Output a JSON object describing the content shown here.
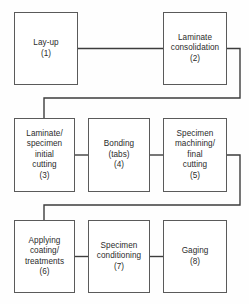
{
  "diagram": {
    "type": "process-flowchart",
    "title": "",
    "orientation": "serpentine-left-to-right",
    "colors": {
      "background": "#fefefe",
      "box_fill": "#ffffff",
      "box_border": "#5a5a5a",
      "connector": "#3d3d3d",
      "text": "#2b2b2b"
    },
    "nodes": [
      {
        "id": "node-1",
        "number": "(1)",
        "lines": [
          "Lay-up"
        ],
        "x": 14,
        "y": 12,
        "w": 64,
        "h": 73,
        "row": 1
      },
      {
        "id": "node-2",
        "number": "(2)",
        "lines": [
          "Laminate",
          "consolidation"
        ],
        "x": 163,
        "y": 12,
        "w": 64,
        "h": 73,
        "row": 1
      },
      {
        "id": "node-3",
        "number": "(3)",
        "lines": [
          "Laminate/",
          "specimen",
          "initial",
          "cutting"
        ],
        "x": 14,
        "y": 118,
        "w": 61,
        "h": 74,
        "row": 2
      },
      {
        "id": "node-4",
        "number": "(4)",
        "lines": [
          "Bonding",
          "(tabs)"
        ],
        "x": 88,
        "y": 118,
        "w": 62,
        "h": 74,
        "row": 2
      },
      {
        "id": "node-5",
        "number": "(5)",
        "lines": [
          "Specimen",
          "machining/",
          "final",
          "cutting"
        ],
        "x": 163,
        "y": 118,
        "w": 64,
        "h": 74,
        "row": 2
      },
      {
        "id": "node-6",
        "number": "(6)",
        "lines": [
          "Applying",
          "coating/",
          "treatments"
        ],
        "x": 14,
        "y": 220,
        "w": 61,
        "h": 73,
        "row": 3
      },
      {
        "id": "node-7",
        "number": "(7)",
        "lines": [
          "Specimen",
          "conditioning"
        ],
        "x": 88,
        "y": 220,
        "w": 62,
        "h": 73,
        "row": 3
      },
      {
        "id": "node-8",
        "number": "(8)",
        "lines": [
          "Gaging"
        ],
        "x": 163,
        "y": 220,
        "w": 64,
        "h": 73,
        "row": 3
      }
    ],
    "connectors": [
      {
        "id": "conn-1-2",
        "from": "node-1",
        "to": "node-2",
        "kind": "straight-horizontal",
        "path": "M 78 48.5 L 163 48.5"
      },
      {
        "id": "conn-2-3",
        "from": "node-2",
        "to": "node-3",
        "kind": "wrap-down-left",
        "path": "M 227 48.5 L 240 48.5 L 240 98 L 44 98 L 44 118"
      },
      {
        "id": "conn-3-4",
        "from": "node-3",
        "to": "node-4",
        "kind": "straight-horizontal",
        "path": "M 75 155 L 88 155"
      },
      {
        "id": "conn-4-5",
        "from": "node-4",
        "to": "node-5",
        "kind": "straight-horizontal",
        "path": "M 150 155 L 163 155"
      },
      {
        "id": "conn-5-6",
        "from": "node-5",
        "to": "node-6",
        "kind": "wrap-down-left",
        "path": "M 227 155 L 240 155 L 240 205 L 44 205 L 44 220"
      },
      {
        "id": "conn-6-7",
        "from": "node-6",
        "to": "node-7",
        "kind": "straight-horizontal",
        "path": "M 75 256.5 L 88 256.5"
      },
      {
        "id": "conn-7-8",
        "from": "node-7",
        "to": "node-8",
        "kind": "straight-horizontal",
        "path": "M 150 256.5 L 163 256.5"
      }
    ]
  }
}
